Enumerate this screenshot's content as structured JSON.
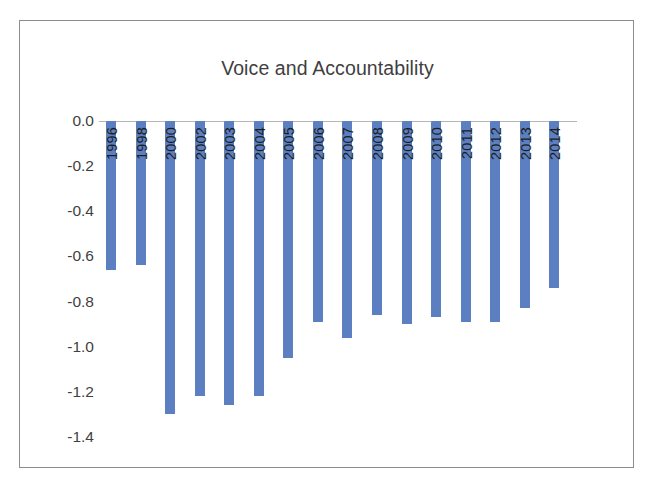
{
  "chart_data": {
    "type": "bar",
    "title": "Voice and Accountability",
    "xlabel": "",
    "ylabel": "",
    "grid": false,
    "legend": "none",
    "orientation": "vertical",
    "bar_color": "#5b7fc0",
    "axis_line_color": "#b5b5b5",
    "frame_color": "#8c8c8c",
    "ylim": [
      -1.4,
      0.0
    ],
    "ytick_labels": [
      "0.0",
      "-0.2",
      "-0.4",
      "-0.6",
      "-0.8",
      "-1.0",
      "-1.2",
      "-1.4"
    ],
    "yticks": [
      0.0,
      -0.2,
      -0.4,
      -0.6,
      -0.8,
      -1.0,
      -1.2,
      -1.4
    ],
    "categories": [
      "1996",
      "1998",
      "2000",
      "2002",
      "2003",
      "2004",
      "2005",
      "2006",
      "2007",
      "2008",
      "2009",
      "2010",
      "2011",
      "2012",
      "2013",
      "2014"
    ],
    "values": [
      -0.66,
      -0.64,
      -1.3,
      -1.22,
      -1.26,
      -1.22,
      -1.05,
      -0.89,
      -0.96,
      -0.86,
      -0.9,
      -0.87,
      -0.89,
      -0.89,
      -0.83,
      -0.74
    ]
  }
}
